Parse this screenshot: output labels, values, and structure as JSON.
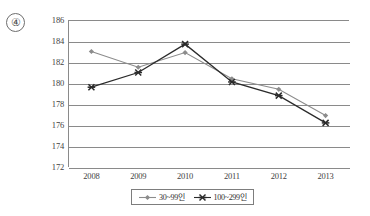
{
  "option_marker": {
    "label": "④"
  },
  "chart_data": {
    "type": "line",
    "title": "",
    "xlabel": "",
    "ylabel": "",
    "categories": [
      "2008",
      "2009",
      "2010",
      "2011",
      "2012",
      "2013"
    ],
    "yticks": [
      "186",
      "184",
      "182",
      "180",
      "178",
      "176",
      "174",
      "172"
    ],
    "ylim": [
      172,
      186
    ],
    "ytick_step": 2,
    "grid": "horizontal",
    "legend_position": "bottom-center",
    "series": [
      {
        "name": "30~99인",
        "marker": "diamond",
        "color": "#8c8c8c",
        "values": [
          183.0,
          181.5,
          182.9,
          180.4,
          179.4,
          176.9
        ]
      },
      {
        "name": "100~299인",
        "marker": "x-bar",
        "color": "#2b2b2b",
        "values": [
          179.6,
          181.0,
          183.7,
          180.1,
          178.8,
          176.2
        ]
      }
    ]
  },
  "legend": {
    "entries": [
      {
        "label": "30~99인"
      },
      {
        "label": "100~299인"
      }
    ]
  }
}
